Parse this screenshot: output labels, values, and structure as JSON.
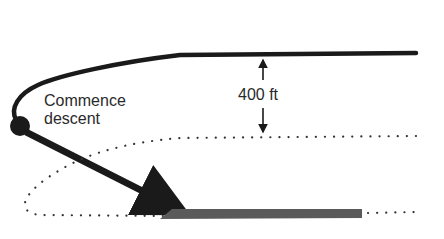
{
  "diagram": {
    "labels": {
      "commence_line1": "Commence",
      "commence_line2": "descent",
      "altitude": "400 ft"
    },
    "elements": {
      "level_flight_path": "solid line at altitude",
      "descent_point": "filled circle",
      "descent_arrow": "arrow from descent point to runway",
      "altitude_indicator": "double-headed vertical arrow",
      "traffic_pattern": "dotted circuit pattern",
      "runway": "gray bar"
    },
    "colors": {
      "line": "#1a1a1a",
      "runway": "#5a5a5a",
      "dots": "#333333",
      "text": "#2a2a2a"
    }
  }
}
